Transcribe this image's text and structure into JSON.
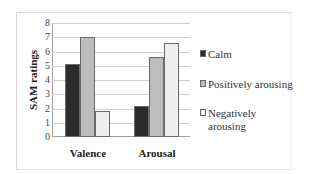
{
  "chart_data": {
    "type": "bar",
    "title": "",
    "xlabel": "",
    "ylabel": "SAM ratings",
    "ylim": [
      0,
      8
    ],
    "yticks": [
      "0",
      "1",
      "2",
      "3",
      "4",
      "5",
      "6",
      "7",
      "8"
    ],
    "grid": true,
    "legend_position": "right",
    "categories": [
      "Valence",
      "Arousal"
    ],
    "series": [
      {
        "name": "Calm",
        "color": "#2b2b2b",
        "values": [
          5.15,
          2.15
        ]
      },
      {
        "name": "Positively arousing",
        "color": "#bdbdbd",
        "values": [
          7.0,
          5.65
        ]
      },
      {
        "name": "Negatively arousing",
        "color": "#efefef",
        "values": [
          1.8,
          6.6
        ]
      }
    ]
  },
  "legend": {
    "calm": "Calm",
    "positive": "Positively arousing",
    "negative_line1": "Negatively",
    "negative_line2": "arousing"
  }
}
